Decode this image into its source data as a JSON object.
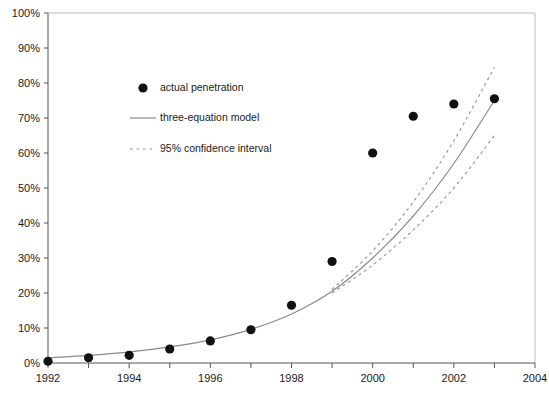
{
  "chart_data": {
    "type": "scatter",
    "title": "",
    "subtitle": "",
    "xlabel": "",
    "ylabel": "",
    "xlim": [
      1992,
      2004
    ],
    "ylim": [
      0,
      100
    ],
    "grid": false,
    "legend_position": "upper-left-inside",
    "x_tick_labels": [
      "1992",
      "1994",
      "1996",
      "1998",
      "2000",
      "2002",
      "2004"
    ],
    "x_tick_values": [
      1992,
      1994,
      1996,
      1998,
      2000,
      2002,
      2004
    ],
    "x_minor_tick_values": [
      1993,
      1995,
      1997,
      1999,
      2001,
      2003
    ],
    "y_tick_labels": [
      "0%",
      "10%",
      "20%",
      "30%",
      "40%",
      "50%",
      "60%",
      "70%",
      "80%",
      "90%",
      "100%"
    ],
    "y_tick_values": [
      0,
      10,
      20,
      30,
      40,
      50,
      60,
      70,
      80,
      90,
      100
    ],
    "series": [
      {
        "name": "actual penetration",
        "type": "scatter",
        "marker": "filled-circle",
        "color": "#111111",
        "x": [
          1992,
          1993,
          1994,
          1995,
          1996,
          1997,
          1998,
          1999,
          2000,
          2001,
          2002,
          2003
        ],
        "values": [
          0.5,
          1.5,
          2.2,
          4.0,
          6.3,
          9.5,
          16.5,
          29.0,
          60.0,
          70.5,
          74.0,
          75.5
        ]
      },
      {
        "name": "three-equation model",
        "type": "line",
        "style": "solid",
        "color": "#8a8a8a",
        "x": [
          1992,
          1993,
          1994,
          1995,
          1996,
          1997,
          1998,
          1999,
          2000,
          2001,
          2002,
          2003
        ],
        "values": [
          1.5,
          2.2,
          3.2,
          4.6,
          6.6,
          9.6,
          14.0,
          20.5,
          30.0,
          42.0,
          57.0,
          75.0
        ]
      },
      {
        "name": "95% confidence interval upper",
        "type": "line",
        "style": "dashed",
        "color": "#9a9a9a",
        "x": [
          1999,
          2000,
          2001,
          2002,
          2003
        ],
        "values": [
          21.0,
          32.0,
          46.0,
          63.5,
          84.5
        ]
      },
      {
        "name": "95% confidence interval lower",
        "type": "line",
        "style": "dashed",
        "color": "#9a9a9a",
        "x": [
          1999,
          2000,
          2001,
          2002,
          2003
        ],
        "values": [
          20.0,
          28.0,
          38.0,
          50.0,
          65.0
        ]
      }
    ],
    "legend_entries": [
      {
        "label": "actual penetration",
        "marker": "filled-circle"
      },
      {
        "label": "three-equation model",
        "marker": "solid-line"
      },
      {
        "label": "95% confidence interval",
        "marker": "dashed-line"
      }
    ]
  },
  "colors": {
    "marker": "#111111",
    "model_line": "#8a8a8a",
    "ci_line": "#9a9a9a",
    "axis": "#555555",
    "frame": "#b9b9b9",
    "background": "#ffffff"
  }
}
